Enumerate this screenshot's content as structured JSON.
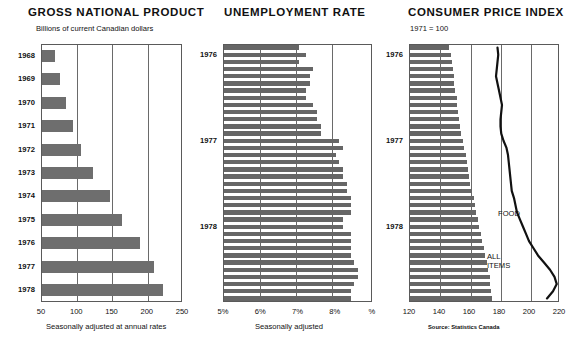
{
  "gnp": {
    "title": "GROSS NATIONAL PRODUCT",
    "subtitle": "Billions of current Canadian dollars",
    "axis_caption": "Seasonally adjusted at annual rates",
    "x_ticks": [
      "50",
      "100",
      "150",
      "200",
      "250"
    ],
    "xlim": [
      50,
      250
    ],
    "year_labels": [
      "1968",
      "1969",
      "1970",
      "1971",
      "1972",
      "1973",
      "1974",
      "1975",
      "1976",
      "1977",
      "1978"
    ],
    "values": [
      68,
      76,
      84,
      94,
      105,
      122,
      146,
      163,
      189,
      209,
      222
    ]
  },
  "unemployment": {
    "title": "UNEMPLOYMENT RATE",
    "axis_caption": "Seasonally adjusted",
    "x_ticks": [
      "5%",
      "6%",
      "7%",
      "8%",
      "%"
    ],
    "xlim": [
      5,
      9
    ],
    "year_labels": [
      "1976",
      "1977",
      "1978"
    ],
    "values": [
      7.0,
      7.2,
      7.0,
      7.4,
      7.3,
      7.3,
      7.2,
      7.2,
      7.4,
      7.5,
      7.5,
      7.6,
      7.6,
      8.1,
      8.2,
      8.0,
      8.1,
      8.2,
      8.2,
      8.3,
      8.3,
      8.4,
      8.4,
      8.4,
      8.2,
      8.2,
      8.4,
      8.4,
      8.4,
      8.4,
      8.5,
      8.6,
      8.6,
      8.5,
      8.4,
      8.4
    ]
  },
  "cpi": {
    "title": "CONSUMER PRICE INDEX",
    "subtitle": "1971  =  100",
    "source": "Source: Statistics Canada",
    "x_ticks": [
      "120",
      "140",
      "160",
      "180",
      "200",
      "220"
    ],
    "xlim": [
      120,
      220
    ],
    "year_labels": [
      "1976",
      "1977",
      "1978"
    ],
    "all_items_label": "ALL\nITEMS",
    "all_items_label_line1": "ALL",
    "all_items_label_line2": "ITEMS",
    "food_label": "FOOD",
    "all_items": [
      146,
      147,
      148,
      148.5,
      149,
      149.5,
      150,
      151,
      151.5,
      152,
      152.5,
      153,
      154,
      155,
      156,
      157,
      158,
      158.5,
      159,
      160,
      161.5,
      162.5,
      163,
      164,
      165,
      166,
      167,
      168,
      169,
      170,
      171,
      172,
      173,
      173.5,
      174,
      174.5
    ],
    "food": [
      179,
      179.5,
      179,
      178.5,
      178,
      179,
      180,
      181,
      182,
      181.5,
      181,
      181,
      181.5,
      183,
      185,
      186,
      186.5,
      187,
      187.5,
      188,
      188.5,
      190,
      191,
      192,
      194,
      196,
      198,
      200,
      203,
      206,
      210,
      214,
      217,
      218.5,
      216,
      212
    ]
  },
  "colors": {
    "bar": "#6e6e6e",
    "line": "#111111",
    "axis": "#5a5a5a"
  }
}
